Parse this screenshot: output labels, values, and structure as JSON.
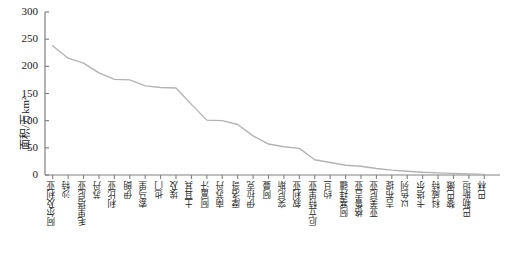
{
  "chart_data": {
    "type": "line",
    "title": "",
    "xlabel": "",
    "ylabel": "面积/万km²",
    "ylim": [
      0,
      300
    ],
    "yticks": [
      0,
      50,
      100,
      150,
      200,
      250,
      300
    ],
    "grid": false,
    "legend": "none",
    "line_color": "#b3b3b3",
    "axis_color": "#808080",
    "categories": [
      "阿尔及利亚",
      "沙特",
      "毛里塔尼亚",
      "苏丹",
      "利比亚",
      "伊朗",
      "索马里",
      "也门",
      "埃及",
      "土耳其",
      "阿富汗",
      "南苏丹",
      "摩洛哥",
      "伊拉克",
      "阿曼",
      "突尼斯",
      "叙利亚",
      "厄立特里亚",
      "约旦",
      "阿塞拜疆",
      "格鲁吉亚",
      "亚美尼亚",
      "吉布提",
      "以色列",
      "卡塔尔",
      "科威特",
      "黎巴嫩",
      "巴勒斯坦",
      "巴林"
    ],
    "values": [
      238,
      215,
      206,
      188,
      176,
      175,
      164,
      161,
      160,
      130,
      101,
      100,
      93,
      72,
      57,
      52,
      49,
      28,
      23,
      18,
      16,
      12,
      9,
      7,
      5,
      4,
      3,
      2,
      1
    ],
    "series": [
      {
        "name": "面积",
        "values": [
          238,
          215,
          206,
          188,
          176,
          175,
          164,
          161,
          160,
          130,
          101,
          100,
          93,
          72,
          57,
          52,
          49,
          28,
          23,
          18,
          16,
          12,
          9,
          7,
          5,
          4,
          3,
          2,
          1
        ]
      }
    ]
  }
}
